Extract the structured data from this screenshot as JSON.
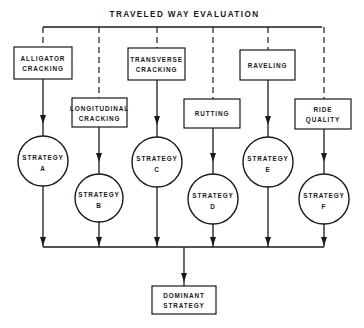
{
  "title": "TRAVELED WAY EVALUATION",
  "distress_boxes": [
    {
      "id": "alligator",
      "line1": "ALLIGATOR",
      "line2": "CRACKING",
      "x": 14,
      "y": 47,
      "w": 58,
      "h": 32,
      "cx": 43
    },
    {
      "id": "longitudinal",
      "line1": "LONGITUDINAL",
      "line2": "CRACKING",
      "x": 72,
      "y": 98,
      "w": 55,
      "h": 29,
      "cx": 99
    },
    {
      "id": "transverse",
      "line1": "TRANSVERSE",
      "line2": "CRACKING",
      "x": 128,
      "y": 48,
      "w": 57,
      "h": 32,
      "cx": 157
    },
    {
      "id": "rutting",
      "line1": "RUTTING",
      "line2": "",
      "x": 184,
      "y": 99,
      "w": 56,
      "h": 29,
      "cx": 213
    },
    {
      "id": "raveling",
      "line1": "RAVELING",
      "line2": "",
      "x": 240,
      "y": 50,
      "w": 55,
      "h": 30,
      "cx": 268
    },
    {
      "id": "ride-quality",
      "line1": "RIDE",
      "line2": "QUALITY",
      "x": 295,
      "y": 99,
      "w": 56,
      "h": 30,
      "cx": 324
    }
  ],
  "strategies": [
    {
      "id": "a",
      "line1": "STRATEGY",
      "line2": "A",
      "cx": 43,
      "cy": 161,
      "r": 25
    },
    {
      "id": "b",
      "line1": "STRATEGY",
      "line2": "B",
      "cx": 99,
      "cy": 198,
      "r": 24
    },
    {
      "id": "c",
      "line1": "STRATEGY",
      "line2": "C",
      "cx": 157,
      "cy": 162,
      "r": 25
    },
    {
      "id": "d",
      "line1": "STRATEGY",
      "line2": "D",
      "cx": 213,
      "cy": 199,
      "r": 25
    },
    {
      "id": "e",
      "line1": "STRATEGY",
      "line2": "E",
      "cx": 268,
      "cy": 162,
      "r": 25
    },
    {
      "id": "f",
      "line1": "STRATEGY",
      "line2": "F",
      "cx": 324,
      "cy": 199,
      "r": 25
    }
  ],
  "output_box": {
    "line1": "DOMINANT",
    "line2": "STRATEGY",
    "x": 152,
    "y": 286,
    "w": 64,
    "h": 28,
    "cx": 184
  },
  "layout": {
    "title_y": 17,
    "top_line_y": 27,
    "top_line_x1": 43,
    "top_line_x2": 322,
    "merge_line_y": 247,
    "merge_x": 184
  },
  "colors": {
    "ink": "#1a1a1a",
    "paper": "#ffffff"
  }
}
